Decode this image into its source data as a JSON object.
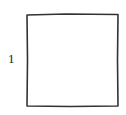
{
  "diagram": {
    "shape": "square",
    "side_label": "1",
    "stroke_color": "#333333",
    "fill_color": "#ffffff"
  }
}
